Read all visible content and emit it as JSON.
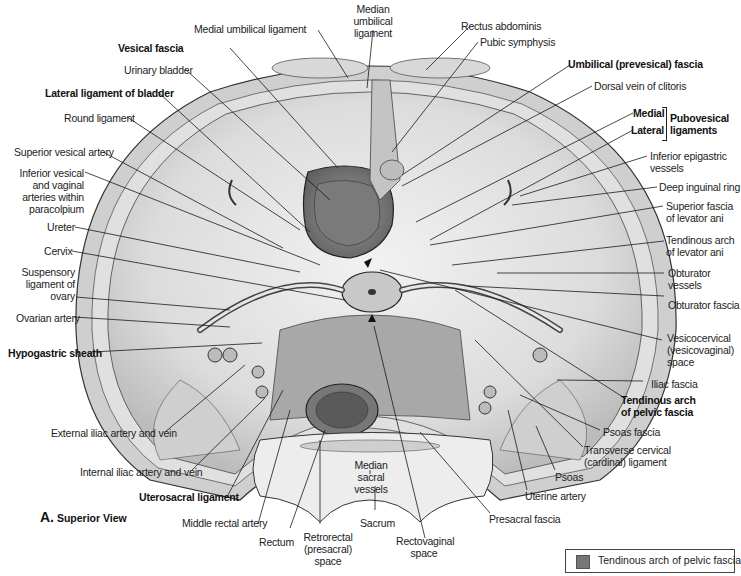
{
  "figure": {
    "view_letter": "A.",
    "view_title": "Superior View",
    "legend": {
      "swatch_color": "#777777",
      "label": "Tendinous arch of pelvic fascia"
    },
    "colors": {
      "outline": "#333333",
      "tissue_light": "#e8e8e8",
      "tissue_mid": "#bdbdbd",
      "tissue_dark": "#6f6f6f",
      "leader": "#1a1a1a"
    }
  },
  "labels": {
    "left": [
      {
        "text": "Vesical fascia",
        "bold": true
      },
      {
        "text": "Urinary bladder",
        "bold": false
      },
      {
        "text": "Lateral ligament of bladder",
        "bold": true
      },
      {
        "text": "Round ligament",
        "bold": false
      },
      {
        "text": "Superior vesical artery",
        "bold": false
      },
      {
        "text": "Inferior vesical and vaginal arteries within paracolpium",
        "bold": false
      },
      {
        "text": "Ureter",
        "bold": false
      },
      {
        "text": "Cervix",
        "bold": false
      },
      {
        "text": "Suspensory ligament of ovary",
        "bold": false
      },
      {
        "text": "Ovarian artery",
        "bold": false
      },
      {
        "text": "Hypogastric sheath",
        "bold": true
      },
      {
        "text": "External iliac artery and vein",
        "bold": false
      },
      {
        "text": "Internal iliac artery and vein",
        "bold": false
      },
      {
        "text": "Uterosacral ligament",
        "bold": true
      },
      {
        "text": "Middle rectal artery",
        "bold": false
      }
    ],
    "top": [
      {
        "text": "Medial umbilical ligament",
        "bold": false
      },
      {
        "text": "Median umbilical ligament",
        "bold": false
      },
      {
        "text": "Rectus abdominis",
        "bold": false
      },
      {
        "text": "Pubic symphysis",
        "bold": false
      }
    ],
    "right": [
      {
        "text": "Umbilical (prevesical) fascia",
        "bold": true
      },
      {
        "text": "Dorsal vein of clitoris",
        "bold": false
      },
      {
        "text": "Medial",
        "bold": true
      },
      {
        "text": "Lateral",
        "bold": true
      },
      {
        "text": "Pubovesical ligaments",
        "bold": true
      },
      {
        "text": "Inferior epigastric vessels",
        "bold": false
      },
      {
        "text": "Deep inguinal ring",
        "bold": false
      },
      {
        "text": "Superior fascia of levator ani",
        "bold": false
      },
      {
        "text": "Tendinous arch of levator ani",
        "bold": false
      },
      {
        "text": "Obturator vessels",
        "bold": false
      },
      {
        "text": "Obturator fascia",
        "bold": false
      },
      {
        "text": "Vesicocervical (vesicovaginal) space",
        "bold": false
      },
      {
        "text": "Iliac fascia",
        "bold": false
      },
      {
        "text": "Tendinous arch of pelvic fascia",
        "bold": true
      },
      {
        "text": "Psoas fascia",
        "bold": false
      },
      {
        "text": "Transverse cervical (cardinal) ligament",
        "bold": false
      }
    ],
    "bottom": [
      {
        "text": "Rectum",
        "bold": false
      },
      {
        "text": "Retrorectal (presacral) space",
        "bold": false
      },
      {
        "text": "Median sacral vessels",
        "bold": false
      },
      {
        "text": "Sacrum",
        "bold": false
      },
      {
        "text": "Rectovaginal space",
        "bold": false
      },
      {
        "text": "Presacral fascia",
        "bold": false
      },
      {
        "text": "Uterine artery",
        "bold": false
      },
      {
        "text": "Psoas",
        "bold": false
      }
    ]
  }
}
